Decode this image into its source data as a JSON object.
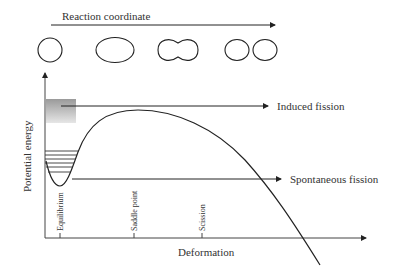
{
  "diagram": {
    "reaction_coordinate": {
      "label": "Reaction coordinate",
      "shapes": [
        "sphere",
        "ellipsoid",
        "necked",
        "two-fragments"
      ]
    },
    "axes": {
      "y_label": "Potential energy",
      "x_label": "Deformation",
      "x_ticks": [
        "Equilibrium",
        "Saddle point",
        "Scission"
      ]
    },
    "arrows": {
      "induced": "Induced fission",
      "spontaneous": "Spontaneous fission"
    },
    "colors": {
      "line": "#222222",
      "text": "#333333",
      "shade_dark": "#9a9a9a",
      "shade_light": "#e2e2e2"
    }
  }
}
